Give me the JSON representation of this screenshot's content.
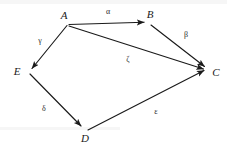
{
  "figure": {
    "type": "directed-graph-diagram",
    "background_color": "#ffffff",
    "ink_color": "#1a1a1a",
    "width": 227,
    "height": 155
  },
  "nodes": [
    {
      "id": "A",
      "label": "A",
      "x": 64,
      "y": 15,
      "vx": 68,
      "vy": 24
    },
    {
      "id": "B",
      "label": "B",
      "x": 150,
      "y": 14,
      "vx": 149,
      "vy": 23
    },
    {
      "id": "C",
      "label": "C",
      "x": 216,
      "y": 72,
      "vx": 208,
      "vy": 70
    },
    {
      "id": "D",
      "label": "D",
      "x": 85,
      "y": 138,
      "vx": 85,
      "vy": 129
    },
    {
      "id": "E",
      "label": "E",
      "x": 17,
      "y": 71,
      "vx": 29,
      "vy": 71
    }
  ],
  "edges": [
    {
      "id": "alpha",
      "label": "α",
      "from": "A",
      "to": "B",
      "lx": 108,
      "ly": 12
    },
    {
      "id": "beta",
      "label": "β",
      "from": "B",
      "to": "C",
      "lx": 186,
      "ly": 35
    },
    {
      "id": "gamma",
      "label": "γ",
      "from": "A",
      "to": "E",
      "lx": 40,
      "ly": 41
    },
    {
      "id": "delta",
      "label": "δ",
      "from": "E",
      "to": "D",
      "lx": 44,
      "ly": 109
    },
    {
      "id": "epsilon",
      "label": "ε",
      "from": "D",
      "to": "C",
      "lx": 156,
      "ly": 112
    },
    {
      "id": "zeta",
      "label": "ζ",
      "from": "A",
      "to": "C",
      "lx": 128,
      "ly": 60
    }
  ]
}
